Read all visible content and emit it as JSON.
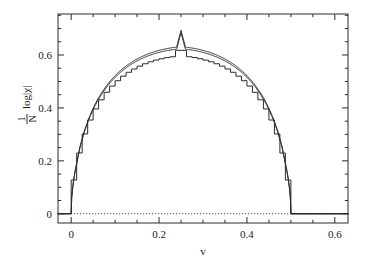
{
  "chart_data": {
    "type": "line",
    "title": "",
    "subtitle": "",
    "xlabel": "v",
    "ylabel": "1/N log|x|",
    "ylabel_parts": {
      "numerator": "1",
      "denominator": "N",
      "rest": "log|χ|"
    },
    "xlim": [
      -0.03,
      0.63
    ],
    "ylim": [
      -0.035,
      0.755
    ],
    "xticks": [
      0,
      0.2,
      0.4,
      0.6
    ],
    "xtick_labels": [
      "0",
      "0.2",
      "0.4",
      "0.6"
    ],
    "yticks": [
      0,
      0.2,
      0.4,
      0.6
    ],
    "ytick_labels": [
      "0",
      "0.2",
      "0.4",
      "0.6"
    ],
    "xminor_step": 0.05,
    "yminor_step": 0.05,
    "grid": false,
    "legend": "none",
    "annotations": [
      {
        "name": "zero-reference-line",
        "type": "hline",
        "y": 0,
        "style": "dotted",
        "x_from": 0,
        "x_to": 0.6
      }
    ],
    "series": [
      {
        "name": "smooth-upper-curve",
        "style": "solid",
        "peak_x": 0.25,
        "peak_y": 0.6931,
        "support": [
          0.0,
          0.5
        ],
        "x": [
          0.0,
          0.01,
          0.02,
          0.03,
          0.04,
          0.05,
          0.06,
          0.07,
          0.08,
          0.09,
          0.1,
          0.11,
          0.12,
          0.13,
          0.14,
          0.15,
          0.16,
          0.17,
          0.18,
          0.19,
          0.2,
          0.21,
          0.22,
          0.23,
          0.24,
          0.25,
          0.26,
          0.27,
          0.28,
          0.29,
          0.3,
          0.31,
          0.32,
          0.33,
          0.34,
          0.35,
          0.36,
          0.37,
          0.38,
          0.39,
          0.4,
          0.41,
          0.42,
          0.43,
          0.44,
          0.45,
          0.46,
          0.47,
          0.48,
          0.49,
          0.5,
          0.52,
          0.56,
          0.6
        ],
        "y": [
          0.0,
          0.1705,
          0.2532,
          0.3131,
          0.3603,
          0.399,
          0.4315,
          0.4592,
          0.4831,
          0.5039,
          0.5221,
          0.5381,
          0.5521,
          0.5645,
          0.5754,
          0.585,
          0.5934,
          0.6008,
          0.6072,
          0.6128,
          0.6176,
          0.6216,
          0.625,
          0.6277,
          0.6298,
          0.6931,
          0.6298,
          0.6277,
          0.625,
          0.6216,
          0.6176,
          0.6128,
          0.6072,
          0.6008,
          0.5934,
          0.585,
          0.5754,
          0.5645,
          0.5521,
          0.5381,
          0.5221,
          0.5039,
          0.4831,
          0.4592,
          0.4315,
          0.399,
          0.3603,
          0.3131,
          0.2532,
          0.1705,
          0.0,
          0.0,
          0.0,
          0.0
        ]
      },
      {
        "name": "smooth-lower-curve",
        "style": "solid",
        "peak_x": 0.25,
        "peak_y": 0.6845,
        "support": [
          0.0,
          0.5
        ]
      },
      {
        "name": "staircase-curve",
        "style": "step",
        "peak_x": 0.25,
        "peak_y": 0.655,
        "support": [
          0.0,
          0.5
        ],
        "steps": 40
      }
    ]
  },
  "figure": {
    "background_color": "#ffffff",
    "axis_color": "#2b2b2b",
    "curve_color": "#2b2b2b"
  }
}
